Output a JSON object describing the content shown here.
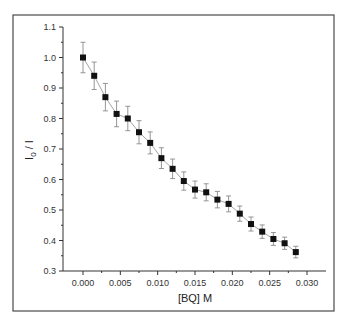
{
  "chart_data": {
    "type": "scatter",
    "title": "",
    "xlabel": "[BQ] M",
    "ylabel": "I0 / I",
    "ylabel_main": "I",
    "ylabel_sub": "0",
    "ylabel_rest": " / I",
    "xlim": [
      0.0,
      0.03
    ],
    "ylim": [
      0.3,
      1.1
    ],
    "x_ticks": [
      "0.000",
      "0.005",
      "0.010",
      "0.015",
      "0.020",
      "0.025",
      "0.030"
    ],
    "y_ticks": [
      "0.3",
      "0.4",
      "0.5",
      "0.6",
      "0.7",
      "0.8",
      "0.9",
      "1.0",
      "1.1"
    ],
    "grid": false,
    "legend": null,
    "series": [
      {
        "name": "I0/I vs [BQ]",
        "marker": "square",
        "line": "connected",
        "x": [
          0.0,
          0.0015,
          0.003,
          0.0045,
          0.006,
          0.0075,
          0.009,
          0.0105,
          0.012,
          0.0135,
          0.015,
          0.0165,
          0.018,
          0.0195,
          0.021,
          0.0225,
          0.024,
          0.0255,
          0.027,
          0.0285
        ],
        "y": [
          1.0,
          0.94,
          0.87,
          0.815,
          0.8,
          0.755,
          0.72,
          0.67,
          0.635,
          0.595,
          0.567,
          0.558,
          0.534,
          0.52,
          0.488,
          0.454,
          0.429,
          0.405,
          0.391,
          0.362
        ],
        "error": [
          0.05,
          0.045,
          0.045,
          0.042,
          0.04,
          0.038,
          0.036,
          0.034,
          0.032,
          0.03,
          0.028,
          0.028,
          0.027,
          0.026,
          0.025,
          0.023,
          0.022,
          0.021,
          0.02,
          0.019
        ]
      }
    ]
  },
  "colors": {
    "marker": "#111111",
    "line": "#9a9a9a",
    "error_bar": "#8a8a8a",
    "frame": "#4a4a4a"
  }
}
